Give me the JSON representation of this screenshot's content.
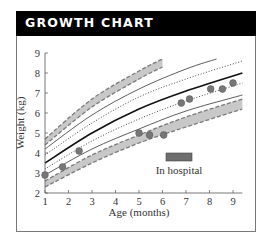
{
  "header": {
    "title": "GROWTH CHART"
  },
  "legend": {
    "hospital_label": "In hospital",
    "hospital_color": "#6e6e6e"
  },
  "colors": {
    "band_fill": "#c8c8c8",
    "band_edge": "#7a7a7a",
    "point_fill": "#777777",
    "line": "#333333"
  },
  "chart_data": {
    "type": "line",
    "title": "GROWTH CHART",
    "xlabel": "Age (months)",
    "ylabel": "Weight (kg)",
    "xlim": [
      1,
      9.4
    ],
    "ylim": [
      2,
      9
    ],
    "x_ticks": [
      1,
      2,
      3,
      4,
      5,
      6,
      7,
      8,
      9
    ],
    "y_ticks": [
      2,
      3,
      4,
      5,
      6,
      7,
      8,
      9
    ],
    "grid": false,
    "legend": [
      {
        "label": "In hospital",
        "marker": "gray rectangle",
        "position": "lower right"
      }
    ],
    "percentile_curves": [
      {
        "name": "upper band (shaded, dashed edges)",
        "style": "band",
        "x": [
          1,
          3,
          5,
          6
        ],
        "y_low": [
          4.4,
          6.3,
          7.7,
          8.3
        ],
        "y_high": [
          4.7,
          6.7,
          8.1,
          8.7
        ]
      },
      {
        "name": "upper solid",
        "style": "solid",
        "x": [
          1,
          3,
          5,
          7,
          8.3
        ],
        "y": [
          4.2,
          5.9,
          7.2,
          8.2,
          8.7
        ]
      },
      {
        "name": "upper dotted",
        "style": "dotted",
        "x": [
          1,
          3,
          5,
          7,
          9.4
        ],
        "y": [
          3.9,
          5.5,
          6.8,
          7.7,
          8.6
        ]
      },
      {
        "name": "median (bold)",
        "style": "bold",
        "x": [
          1,
          3,
          5,
          7,
          9.4
        ],
        "y": [
          3.5,
          5.0,
          6.2,
          7.1,
          8.0
        ]
      },
      {
        "name": "lower dotted",
        "style": "dotted",
        "x": [
          1,
          3,
          5,
          7,
          9.4
        ],
        "y": [
          3.2,
          4.6,
          5.7,
          6.6,
          7.5
        ]
      },
      {
        "name": "lower solid",
        "style": "solid",
        "x": [
          1,
          3,
          5,
          7,
          9.4
        ],
        "y": [
          2.9,
          4.2,
          5.2,
          6.1,
          6.9
        ]
      },
      {
        "name": "lower band (shaded, dashed edges)",
        "style": "band",
        "x": [
          1,
          3,
          5,
          7,
          9.4
        ],
        "y_low": [
          2.3,
          3.5,
          4.5,
          5.3,
          6.2
        ],
        "y_high": [
          2.6,
          3.9,
          4.9,
          5.8,
          6.7
        ]
      }
    ],
    "series": [
      {
        "name": "Measured weight",
        "type": "scatter",
        "x": [
          1.0,
          1.75,
          2.45,
          5.0,
          5.45,
          6.05,
          6.8,
          7.15,
          8.05,
          8.55,
          9.0
        ],
        "y": [
          2.9,
          3.3,
          4.1,
          5.0,
          4.9,
          4.9,
          6.5,
          6.7,
          7.2,
          7.2,
          7.5
        ]
      }
    ],
    "hospital_period_note": "Dip in weight around 5–6 months corresponds to hospital stay"
  }
}
